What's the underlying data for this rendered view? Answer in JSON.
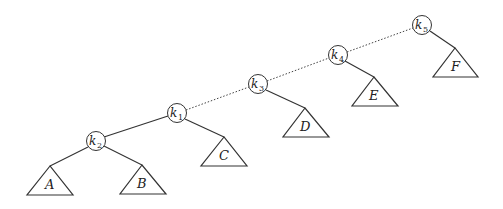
{
  "diagram": {
    "type": "binary-tree",
    "nodes": [
      {
        "id": "k2",
        "base": "k",
        "sub": "2",
        "cx": 96,
        "cy": 141
      },
      {
        "id": "k1",
        "base": "k",
        "sub": "1",
        "cx": 177,
        "cy": 113
      },
      {
        "id": "k3",
        "base": "k",
        "sub": "3",
        "cx": 258,
        "cy": 84
      },
      {
        "id": "k4",
        "base": "k",
        "sub": "4",
        "cx": 338,
        "cy": 55
      },
      {
        "id": "k5",
        "base": "k",
        "sub": "5",
        "cx": 422,
        "cy": 25
      }
    ],
    "subtrees": [
      {
        "id": "A",
        "label": "A",
        "apex": [
          50,
          166
        ],
        "left": [
          27,
          195
        ],
        "right": [
          73,
          195
        ]
      },
      {
        "id": "B",
        "label": "B",
        "apex": [
          142,
          165
        ],
        "left": [
          120,
          194
        ],
        "right": [
          166,
          194
        ]
      },
      {
        "id": "C",
        "label": "C",
        "apex": [
          224,
          137
        ],
        "left": [
          201,
          166
        ],
        "right": [
          247,
          166
        ]
      },
      {
        "id": "D",
        "label": "D",
        "apex": [
          305,
          108
        ],
        "left": [
          283,
          137
        ],
        "right": [
          329,
          137
        ]
      },
      {
        "id": "E",
        "label": "E",
        "apex": [
          374,
          77
        ],
        "left": [
          352,
          106
        ],
        "right": [
          398,
          106
        ]
      },
      {
        "id": "F",
        "label": "F",
        "apex": [
          455,
          48
        ],
        "left": [
          433,
          77
        ],
        "right": [
          478,
          77
        ]
      }
    ],
    "solid_edges": [
      [
        "k2",
        "k1"
      ],
      [
        "k2",
        "A"
      ],
      [
        "k2",
        "B"
      ],
      [
        "k1",
        "C"
      ],
      [
        "k3",
        "D"
      ],
      [
        "k4",
        "E"
      ],
      [
        "k5",
        "F"
      ]
    ],
    "dotted_edges": [
      [
        "k1",
        "k3"
      ],
      [
        "k3",
        "k4"
      ],
      [
        "k4",
        "k5"
      ]
    ]
  }
}
